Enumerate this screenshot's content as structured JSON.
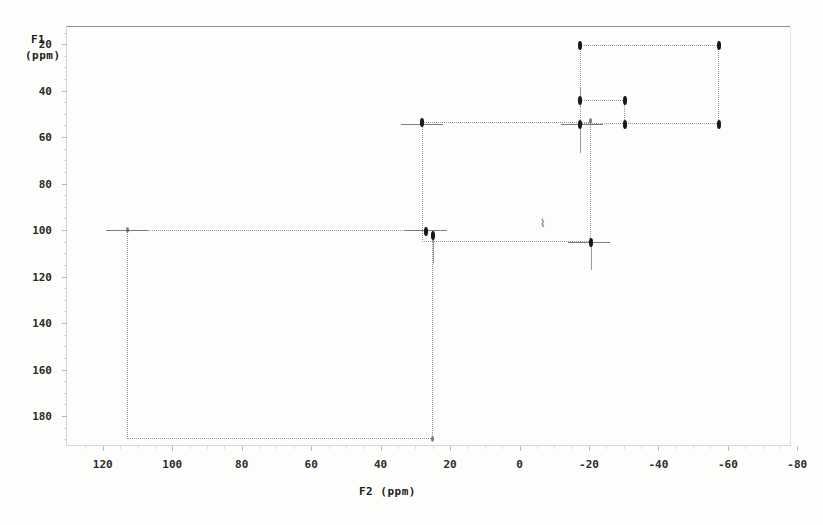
{
  "figure": {
    "kind": "2d-nmr-correlation-spectrum",
    "f1_axis_label": "F1",
    "f1_units_label": "(ppm)",
    "f2_axis_label": "F2 (ppm)",
    "artifact_mark": "⌇"
  },
  "chart_data": {
    "type": "scatter",
    "title": "",
    "subtitle": "",
    "xlabel": "F2 (ppm)",
    "ylabel": "F1 (ppm)",
    "grid": false,
    "legend": "none",
    "xlim": [
      130,
      -88
    ],
    "ylim": [
      193,
      12
    ],
    "x_inverted": true,
    "y_inverted": true,
    "xticks": [
      120,
      100,
      80,
      60,
      40,
      20,
      0,
      -20,
      -40,
      -60,
      -80
    ],
    "xtick_labels": [
      "120",
      "100",
      "80",
      "60",
      "40",
      "20",
      "0",
      "-20",
      "-40",
      "-60",
      "-80"
    ],
    "yticks": [
      20,
      40,
      60,
      80,
      100,
      120,
      140,
      160,
      180
    ],
    "ytick_labels": [
      "20",
      "40",
      "60",
      "80",
      "100",
      "120",
      "140",
      "160",
      "180"
    ],
    "peaks": [
      {
        "name": "peak-a",
        "f2": -17.5,
        "f1": 20.5,
        "intensity": "strong"
      },
      {
        "name": "peak-b",
        "f2": -57.5,
        "f1": 20.5,
        "intensity": "medium"
      },
      {
        "name": "peak-c",
        "f2": -17.5,
        "f1": 44.0,
        "intensity": "strong"
      },
      {
        "name": "peak-d",
        "f2": -30.5,
        "f1": 44.0,
        "intensity": "medium"
      },
      {
        "name": "peak-e",
        "f2": -17.5,
        "f1": 54.5,
        "intensity": "strong"
      },
      {
        "name": "peak-f",
        "f2": -20.5,
        "f1": 53.0,
        "intensity": "weak"
      },
      {
        "name": "peak-g",
        "f2": -30.5,
        "f1": 54.5,
        "intensity": "medium"
      },
      {
        "name": "peak-h",
        "f2": -57.5,
        "f1": 54.5,
        "intensity": "medium"
      },
      {
        "name": "peak-i",
        "f2": 28.0,
        "f1": 53.5,
        "intensity": "medium"
      },
      {
        "name": "peak-j",
        "f2": 25.0,
        "f1": 102.0,
        "intensity": "strong"
      },
      {
        "name": "peak-k",
        "f2": 27.0,
        "f1": 100.5,
        "intensity": "medium"
      },
      {
        "name": "peak-l",
        "f2": -20.5,
        "f1": 105.0,
        "intensity": "strong"
      },
      {
        "name": "peak-m",
        "f2": 113.0,
        "f1": 100.0,
        "intensity": "weak"
      },
      {
        "name": "peak-n",
        "f2": 25.0,
        "f1": 190.0,
        "intensity": "weak"
      }
    ],
    "correlation_boxes": [
      {
        "name": "box-upfield-large",
        "f2_range": [
          -17.5,
          -57.5
        ],
        "f1_range": [
          20.5,
          54.5
        ]
      },
      {
        "name": "box-upfield-small",
        "f2_range": [
          -17.5,
          -30.5
        ],
        "f1_range": [
          44.0,
          54.5
        ]
      },
      {
        "name": "box-middle",
        "f2_range": [
          28.0,
          -20.5
        ],
        "f1_range": [
          53.5,
          105.0
        ]
      },
      {
        "name": "box-downfield",
        "f2_range": [
          113.0,
          25.0
        ],
        "f1_range": [
          100.0,
          190.0
        ]
      }
    ]
  },
  "geometry": {
    "plot": {
      "left": 66,
      "top": 26,
      "width": 725,
      "height": 420
    },
    "x_map": {
      "ppm_at_left": 130.6,
      "px_per_ppm": -3.4725
    },
    "y_map": {
      "ppm_at_top": 12.2,
      "px_per_ppm": 2.3245
    }
  }
}
